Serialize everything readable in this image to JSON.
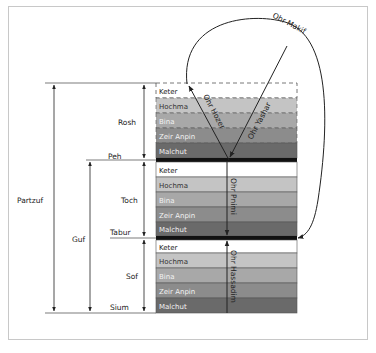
{
  "diagram": {
    "lights": {
      "ohr_makif": "Ohr Makif",
      "ohr_yashar": "Ohr Yashar",
      "ohr_hozer": "Ohr Hozer",
      "ohr_pnimi": "Ohr Pnimi",
      "ohr_hassadim": "Ohr Hassadim"
    },
    "dimensions": {
      "partzuf": "Partzuf",
      "guf": "Guf",
      "rosh": "Rosh",
      "toch": "Toch",
      "sof": "Sof"
    },
    "boundaries": {
      "peh": "Peh",
      "tabur": "Tabur",
      "sium": "Sium"
    },
    "sections": [
      {
        "name": "Rosh",
        "sefirot": [
          "Keter",
          "Hochma",
          "Bina",
          "Zeir Anpin",
          "Malchut"
        ]
      },
      {
        "name": "Toch",
        "sefirot": [
          "Keter",
          "Hochma",
          "Bina",
          "Zeir Anpin",
          "Malchut"
        ]
      },
      {
        "name": "Sof",
        "sefirot": [
          "Keter",
          "Hochma",
          "Bina",
          "Zeir Anpin",
          "Malchut"
        ]
      }
    ],
    "colors": {
      "keter": "#ffffff",
      "hochma": "#c4c4c4",
      "bina": "#a8a8a8",
      "zeir_anpin": "#8c8c8c",
      "malchut": "#6a6a6a",
      "screen": "#111111",
      "line": "#222222"
    }
  }
}
